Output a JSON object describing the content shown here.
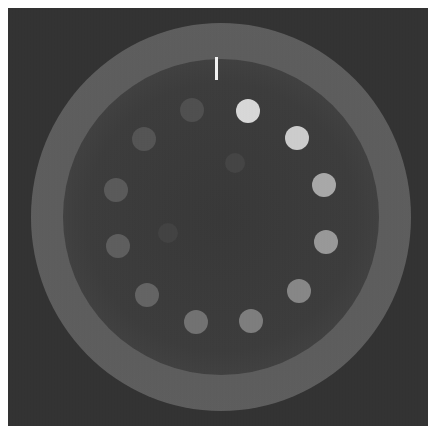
{
  "image": {
    "description": "CT phantom cross-section showing low-contrast detectability module",
    "background_color": "#323232",
    "border_color": "#ffffff"
  },
  "phantom": {
    "outer_ring": {
      "cx": 213,
      "cy": 209,
      "rx": 190,
      "ry": 194,
      "color": "#7a7a7a"
    },
    "inner_disk": {
      "cx": 213,
      "cy": 209,
      "r": 158,
      "color": "#3c3c3c"
    },
    "marker": {
      "x": 207,
      "y": 49,
      "width": 3,
      "height": 23,
      "color": "#f2f2f2"
    },
    "inserts": [
      {
        "cx": 240,
        "cy": 103,
        "r": 12,
        "color": "#d9d9d9"
      },
      {
        "cx": 289,
        "cy": 130,
        "r": 12,
        "color": "#cdcdcd"
      },
      {
        "cx": 316,
        "cy": 177,
        "r": 12,
        "color": "#a9a9a9"
      },
      {
        "cx": 318,
        "cy": 234,
        "r": 12,
        "color": "#999999"
      },
      {
        "cx": 291,
        "cy": 283,
        "r": 12,
        "color": "#878787"
      },
      {
        "cx": 243,
        "cy": 313,
        "r": 12,
        "color": "#7e7e7e"
      },
      {
        "cx": 188,
        "cy": 314,
        "r": 12,
        "color": "#727272"
      },
      {
        "cx": 139,
        "cy": 287,
        "r": 12,
        "color": "#646464"
      },
      {
        "cx": 110,
        "cy": 238,
        "r": 12,
        "color": "#5e5e5e"
      },
      {
        "cx": 108,
        "cy": 182,
        "r": 12,
        "color": "#5a5a5a"
      },
      {
        "cx": 136,
        "cy": 131,
        "r": 12,
        "color": "#545454"
      },
      {
        "cx": 184,
        "cy": 102,
        "r": 12,
        "color": "#4f4f4f"
      },
      {
        "cx": 227,
        "cy": 155,
        "r": 10,
        "color": "#444444"
      },
      {
        "cx": 160,
        "cy": 225,
        "r": 10,
        "color": "#424242"
      }
    ]
  }
}
